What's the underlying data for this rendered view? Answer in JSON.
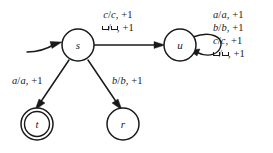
{
  "diagram": {
    "type": "finite-state-machine",
    "blank_symbol": "␣",
    "colors": {
      "background": "#ffffff",
      "stroke": "#1a1a1a",
      "text": "#1a1a1a"
    },
    "states": [
      {
        "id": "s",
        "label": "s",
        "accepting": false,
        "start": true,
        "cx": 78,
        "cy": 45,
        "r": 16
      },
      {
        "id": "u",
        "label": "u",
        "accepting": false,
        "start": false,
        "cx": 180,
        "cy": 45,
        "r": 16
      },
      {
        "id": "t",
        "label": "t",
        "accepting": true,
        "start": false,
        "cx": 37,
        "cy": 124,
        "r": 16
      },
      {
        "id": "r",
        "label": "r",
        "accepting": false,
        "start": false,
        "cx": 123,
        "cy": 124,
        "r": 16
      }
    ],
    "transitions": [
      {
        "id": "s-to-u",
        "from": "s",
        "to": "u",
        "label_lines": [
          "c/c, +1",
          "␣/␣, +1"
        ],
        "reads": [
          "c",
          "␣"
        ],
        "writes": [
          "c",
          "␣"
        ],
        "moves": [
          "+1",
          "+1"
        ]
      },
      {
        "id": "s-to-t",
        "from": "s",
        "to": "t",
        "label_lines": [
          "a/a, +1"
        ],
        "reads": [
          "a"
        ],
        "writes": [
          "a"
        ],
        "moves": [
          "+1"
        ]
      },
      {
        "id": "s-to-r",
        "from": "s",
        "to": "r",
        "label_lines": [
          "b/b, +1"
        ],
        "reads": [
          "b"
        ],
        "writes": [
          "b"
        ],
        "moves": [
          "+1"
        ]
      },
      {
        "id": "u-self-loop",
        "from": "u",
        "to": "u",
        "label_lines": [
          "a/a, +1",
          "b/b, +1",
          "c/c, +1",
          "␣/␣, +1"
        ],
        "reads": [
          "a",
          "b",
          "c",
          "␣"
        ],
        "writes": [
          "a",
          "b",
          "c",
          "␣"
        ],
        "moves": [
          "+1",
          "+1",
          "+1",
          "+1"
        ]
      }
    ],
    "labels": {
      "top": {
        "line1_read": "c",
        "line1_write": "c",
        "line1_move": ", +1",
        "line2_move": ", +1"
      },
      "left": {
        "read": "a",
        "write": "a",
        "move": ", +1"
      },
      "right": {
        "read": "b",
        "write": "b",
        "move": ", +1"
      },
      "loop": {
        "line1_read": "a",
        "line1_write": "a",
        "line1_move": ", +1",
        "line2_read": "b",
        "line2_write": "b",
        "line2_move": ", +1",
        "line3_read": "c",
        "line3_write": "c",
        "line3_move": ", +1",
        "line4_move": ", +1"
      }
    }
  }
}
